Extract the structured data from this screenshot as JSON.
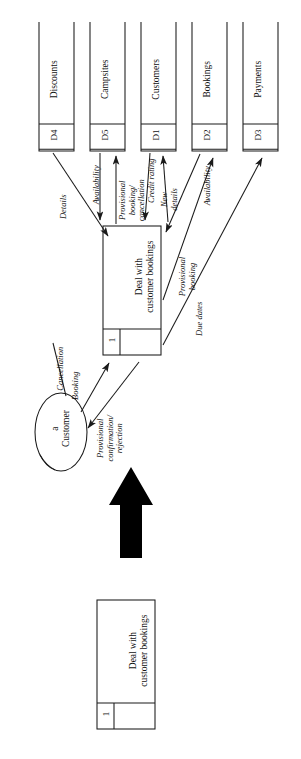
{
  "diagram": {
    "type": "data-flow-diagram",
    "orientation": "rotated-90-ccw",
    "page_background": "#ffffff",
    "ink_color": "#111111",
    "process": {
      "id": "1",
      "name": "Deal with customer bookings",
      "name_line1": "Deal with",
      "name_line2": "customer bookings"
    },
    "detail_process": {
      "id": "1",
      "name_line1": "Deal with",
      "name_line2": "customer bookings"
    },
    "external_entity": {
      "label_line1": "a",
      "label_line2": "Customer",
      "shape": "ellipse"
    },
    "data_stores": [
      {
        "id": "D4",
        "name": "Discounts"
      },
      {
        "id": "D5",
        "name": "Campsites"
      },
      {
        "id": "D1",
        "name": "Customers"
      },
      {
        "id": "D2",
        "name": "Bookings"
      },
      {
        "id": "D3",
        "name": "Payments"
      }
    ],
    "flows": [
      {
        "label": "Details",
        "from": "D4",
        "to": "process-1"
      },
      {
        "label": "Availability",
        "from": "D5",
        "to": "process-1"
      },
      {
        "label": "Provisional booking/ cancellation",
        "line1": "Provisional",
        "line2": "booking/",
        "line3": "cancellation",
        "from": "process-1",
        "to": "D5"
      },
      {
        "label": "Credit rating",
        "from": "D1",
        "to": "process-1"
      },
      {
        "label": "New details",
        "line1": "New",
        "line2": "details",
        "from": "process-1",
        "to": "D1"
      },
      {
        "label": "Availability",
        "from": "D2",
        "to": "process-1"
      },
      {
        "label": "Provisional booking",
        "line1": "Provisional",
        "line2": "booking",
        "from": "process-1",
        "to": "D2"
      },
      {
        "label": "Due dates",
        "from": "process-1",
        "to": "D3"
      },
      {
        "label": "Cancellation",
        "from": "a Customer",
        "to": "process-1"
      },
      {
        "label": "Booking",
        "from": "a Customer",
        "to": "process-1"
      },
      {
        "label": "Provisional confirmation/ rejection",
        "line1": "Provisional",
        "line2": "confirmation/",
        "line3": "rejection",
        "from": "process-1",
        "to": "a Customer"
      }
    ],
    "callout_arrow": {
      "name": "thick-block-arrow",
      "direction": "up",
      "color": "#000000"
    }
  }
}
